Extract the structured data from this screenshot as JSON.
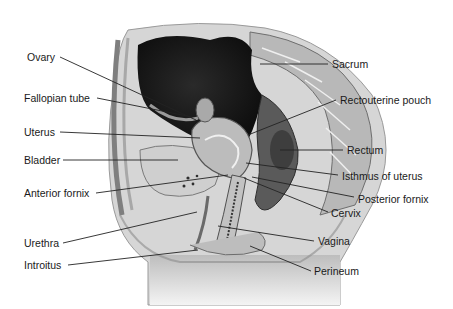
{
  "diagram": {
    "labels_left": [
      {
        "id": "ovary",
        "text": "Ovary",
        "x": 27,
        "y": 51,
        "line": [
          60,
          57,
          196,
          120
        ]
      },
      {
        "id": "fallopian-tube",
        "text": "Fallopian tube",
        "x": 24,
        "y": 92,
        "line": [
          97,
          98,
          192,
          117
        ]
      },
      {
        "id": "uterus",
        "text": "Uterus",
        "x": 24,
        "y": 126,
        "line": [
          60,
          132,
          200,
          138
        ]
      },
      {
        "id": "bladder",
        "text": "Bladder",
        "x": 24,
        "y": 154,
        "line": [
          63,
          160,
          178,
          160
        ]
      },
      {
        "id": "anterior-fornix",
        "text": "Anterior fornix",
        "x": 24,
        "y": 187,
        "line": [
          96,
          193,
          228,
          175
        ]
      },
      {
        "id": "urethra",
        "text": "Urethra",
        "x": 24,
        "y": 237,
        "line": [
          63,
          243,
          197,
          212
        ]
      },
      {
        "id": "introitus",
        "text": "Introitus",
        "x": 24,
        "y": 259,
        "line": [
          68,
          265,
          198,
          250
        ]
      }
    ],
    "labels_right": [
      {
        "id": "sacrum",
        "text": "Sacrum",
        "x": 332,
        "y": 58,
        "line": [
          328,
          64,
          260,
          64
        ]
      },
      {
        "id": "rectouterine-pouch",
        "text": "Rectouterine pouch",
        "x": 340,
        "y": 94,
        "line": [
          336,
          100,
          248,
          135
        ]
      },
      {
        "id": "rectum",
        "text": "Rectum",
        "x": 347,
        "y": 144,
        "line": [
          343,
          150,
          280,
          150
        ]
      },
      {
        "id": "isthmus-of-uterus",
        "text": "Isthmus of uterus",
        "x": 342,
        "y": 170,
        "line": [
          338,
          175,
          246,
          163
        ]
      },
      {
        "id": "posterior-fornix",
        "text": "Posterior fornix",
        "x": 358,
        "y": 193,
        "line": [
          354,
          197,
          252,
          177
        ]
      },
      {
        "id": "cervix",
        "text": "Cervix",
        "x": 331,
        "y": 207,
        "line": [
          328,
          212,
          244,
          178
        ]
      },
      {
        "id": "vagina",
        "text": "Vagina",
        "x": 318,
        "y": 235,
        "line": [
          314,
          241,
          218,
          226
        ]
      },
      {
        "id": "perineum",
        "text": "Perineum",
        "x": 314,
        "y": 265,
        "line": [
          311,
          271,
          250,
          246
        ]
      }
    ],
    "colors": {
      "background": "#ffffff",
      "label_text": "#1a1a1a",
      "leader_line": "#222222",
      "tissue_dark": "#1c1c1c",
      "tissue_mid": "#8a8a8a",
      "tissue_light": "#c8c8c8"
    }
  }
}
